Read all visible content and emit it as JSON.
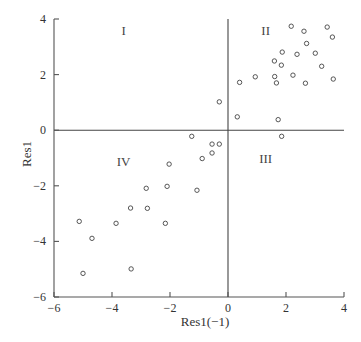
{
  "chart_data": {
    "type": "scatter",
    "title": "",
    "xlabel": "Res1(−1)",
    "ylabel": "Res1",
    "xlim": [
      -6,
      4
    ],
    "ylim": [
      -6,
      4
    ],
    "xticks": [
      -6,
      -4,
      -2,
      0,
      2,
      4
    ],
    "yticks": [
      -6,
      -4,
      -2,
      0,
      2,
      4
    ],
    "xtick_labels": [
      "−6",
      "−4",
      "−2",
      "0",
      "2",
      "4"
    ],
    "ytick_labels": [
      "−6",
      "−4",
      "−2",
      "0",
      "2",
      "4"
    ],
    "grid": false,
    "reference_lines": {
      "x": 0,
      "y": 0
    },
    "quadrant_labels": [
      {
        "text": "I",
        "x": -3.6,
        "y": 3.6
      },
      {
        "text": "II",
        "x": 1.3,
        "y": 3.6
      },
      {
        "text": "III",
        "x": 1.3,
        "y": -1.0
      },
      {
        "text": "IV",
        "x": -3.6,
        "y": -1.1
      }
    ],
    "marker": "open-circle",
    "points": [
      [
        2.18,
        3.74
      ],
      [
        2.62,
        3.56
      ],
      [
        3.42,
        3.71
      ],
      [
        3.6,
        3.35
      ],
      [
        2.71,
        3.12
      ],
      [
        1.87,
        2.81
      ],
      [
        2.38,
        2.73
      ],
      [
        3.01,
        2.77
      ],
      [
        1.6,
        2.49
      ],
      [
        1.84,
        2.34
      ],
      [
        3.23,
        2.3
      ],
      [
        0.94,
        1.92
      ],
      [
        1.61,
        1.93
      ],
      [
        2.24,
        1.98
      ],
      [
        3.63,
        1.84
      ],
      [
        0.4,
        1.72
      ],
      [
        1.67,
        1.7
      ],
      [
        2.67,
        1.69
      ],
      [
        -0.3,
        1.02
      ],
      [
        0.32,
        0.48
      ],
      [
        1.73,
        0.38
      ],
      [
        -1.25,
        -0.22
      ],
      [
        1.85,
        -0.22
      ],
      [
        -0.55,
        -0.5
      ],
      [
        -0.3,
        -0.5
      ],
      [
        -0.55,
        -0.82
      ],
      [
        -0.89,
        -1.02
      ],
      [
        -2.03,
        -1.22
      ],
      [
        -2.82,
        -2.09
      ],
      [
        -2.1,
        -2.02
      ],
      [
        -1.07,
        -2.16
      ],
      [
        -3.36,
        -2.8
      ],
      [
        -2.78,
        -2.81
      ],
      [
        -5.13,
        -3.28
      ],
      [
        -3.86,
        -3.35
      ],
      [
        -2.16,
        -3.35
      ],
      [
        -4.69,
        -3.89
      ],
      [
        -3.34,
        -4.99
      ],
      [
        -5.0,
        -5.15
      ]
    ]
  }
}
